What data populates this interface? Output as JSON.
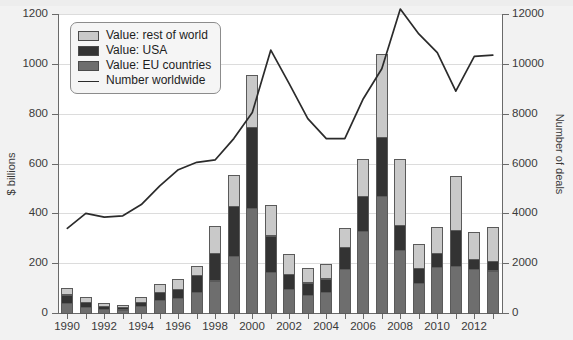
{
  "chart_data": {
    "type": "bar",
    "title": "",
    "xlabel": "",
    "ylabel": "$ billions",
    "y2label": "Number of deals",
    "grid": true,
    "legend_position": "top-left",
    "ylim": [
      0,
      1200
    ],
    "y2lim": [
      0,
      12000
    ],
    "yticks": [
      0,
      200,
      400,
      600,
      800,
      1000,
      1200
    ],
    "y2ticks": [
      0,
      2000,
      4000,
      6000,
      8000,
      10000,
      12000
    ],
    "categories": [
      "1990",
      "1991",
      "1992",
      "1993",
      "1994",
      "1995",
      "1996",
      "1997",
      "1998",
      "1999",
      "2000",
      "2001",
      "2002",
      "2003",
      "2004",
      "2005",
      "2006",
      "2007",
      "2008",
      "2009",
      "2010",
      "2011",
      "2012",
      "2013"
    ],
    "xtick_labels": [
      "1990",
      "1992",
      "1994",
      "1996",
      "1998",
      "2000",
      "2002",
      "2004",
      "2006",
      "2008",
      "2010",
      "2012"
    ],
    "stacked": true,
    "series": [
      {
        "name": "Value: EU countries",
        "color": "#6e6e6e",
        "values": [
          40,
          23,
          17,
          13,
          27,
          52,
          62,
          86,
          130,
          230,
          420,
          165,
          95,
          72,
          85,
          175,
          330,
          470,
          255,
          120,
          185,
          190,
          175,
          170
        ]
      },
      {
        "name": "Value: USA",
        "color": "#333333",
        "values": [
          34,
          22,
          12,
          10,
          18,
          32,
          35,
          67,
          110,
          200,
          325,
          145,
          60,
          50,
          53,
          90,
          140,
          235,
          100,
          60,
          55,
          145,
          40,
          42
        ]
      },
      {
        "name": "Value: rest of world",
        "color": "#c9c9c9",
        "values": [
          26,
          20,
          11,
          10,
          20,
          33,
          40,
          35,
          110,
          125,
          210,
          122,
          80,
          58,
          57,
          75,
          150,
          335,
          265,
          98,
          105,
          215,
          110,
          135
        ]
      }
    ],
    "line_series": {
      "name": "Number worldwide",
      "color": "#2b2b2b",
      "axis": "right",
      "values": [
        3400,
        4000,
        3850,
        3900,
        4350,
        5100,
        5750,
        6050,
        6150,
        7000,
        8050,
        10550,
        9200,
        7800,
        7000,
        7000,
        8600,
        9800,
        12200,
        11200,
        10450,
        8900,
        10300,
        10350
      ]
    }
  },
  "legend": {
    "items": [
      {
        "label": "Value: rest of world",
        "swatch": "rest-of-world-swatch",
        "type": "box"
      },
      {
        "label": "Value: USA",
        "swatch": "usa-swatch",
        "type": "box"
      },
      {
        "label": "Value: EU countries",
        "swatch": "eu-swatch",
        "type": "box"
      },
      {
        "label": "Number worldwide",
        "swatch": "worldwide-line-swatch",
        "type": "line"
      }
    ]
  },
  "colors": {
    "rest_of_world": "#c9c9c9",
    "usa": "#333333",
    "eu_countries": "#6e6e6e",
    "line": "#2b2b2b",
    "plot_background": "#ffffff",
    "page_background": "#f2f2f2",
    "gridline": "#dcdcdc",
    "axis": "#6a6a6a"
  }
}
